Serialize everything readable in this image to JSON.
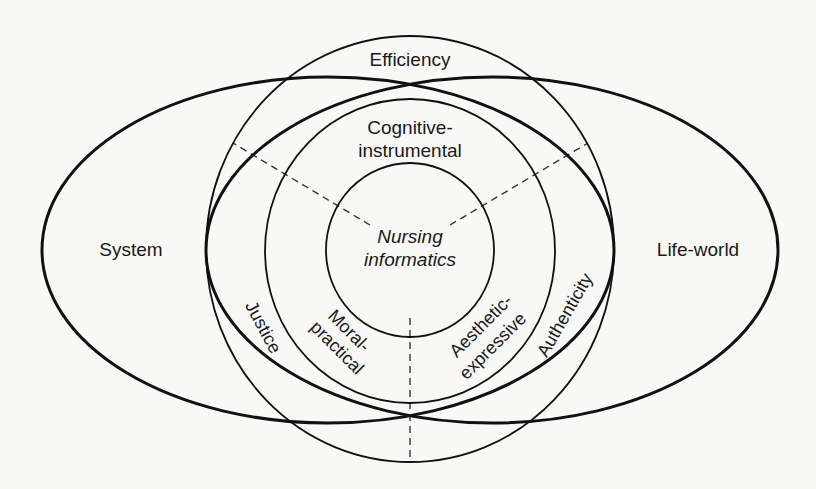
{
  "diagram": {
    "type": "nested-concentric-venn",
    "colors": {
      "background": "#f8f8f6",
      "stroke": "#111111",
      "text": "#1a1a1a"
    },
    "regions": {
      "outer_ring": {
        "top_label": "Efficiency",
        "left_label": "Justice",
        "right_label": "Authenticity"
      },
      "left_ellipse": {
        "label": "System"
      },
      "right_ellipse": {
        "label": "Life-world"
      },
      "middle_ring": {
        "top_label_line1": "Cognitive-",
        "top_label_line2": "instrumental",
        "left_label_line1": "Moral-",
        "left_label_line2": "practical",
        "right_label_line1": "Aesthetic-",
        "right_label_line2": "expressive"
      },
      "center": {
        "label_line1": "Nursing",
        "label_line2": "informatics"
      }
    },
    "dividers": [
      "upper-left dashed",
      "upper-right dashed",
      "bottom dashed"
    ]
  }
}
